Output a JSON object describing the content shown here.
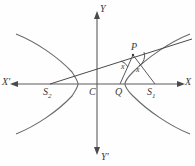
{
  "figure": {
    "background_color": "#fefefe",
    "stroke_color": "#5b5b5b",
    "width": 195,
    "height": 166
  },
  "axes": {
    "x_positive_label": "X",
    "x_negative_label": "X'",
    "y_positive_label": "Y",
    "y_negative_label": "Y'",
    "x_axis_y": 84,
    "y_axis_x": 97
  },
  "points": {
    "center": {
      "label": "C",
      "x": 97,
      "y": 84
    },
    "focus_right": {
      "label": "S",
      "sub": "1",
      "x": 153,
      "y": 84
    },
    "focus_left": {
      "label": "S",
      "sub": "2",
      "x": 50,
      "y": 84
    },
    "foot": {
      "label": "Q",
      "x": 122,
      "y": 84
    },
    "on_curve": {
      "label": "P",
      "x": 133,
      "y": 55
    }
  },
  "angles": [
    {
      "label": "x",
      "at": "left-of-P"
    },
    {
      "label": "x",
      "at": "right-of-P"
    }
  ],
  "curves": {
    "right_branch_vertex_x": 125,
    "left_branch_vertex_x": 75,
    "description": "hyperbola with two opposing branches"
  },
  "lines": [
    {
      "name": "focal-chord-S2-P",
      "from": "S2",
      "through": "P"
    },
    {
      "name": "segment-P-Q",
      "from": "P",
      "to": "Q"
    },
    {
      "name": "segment-P-S1",
      "from": "P",
      "to": "S1"
    }
  ]
}
